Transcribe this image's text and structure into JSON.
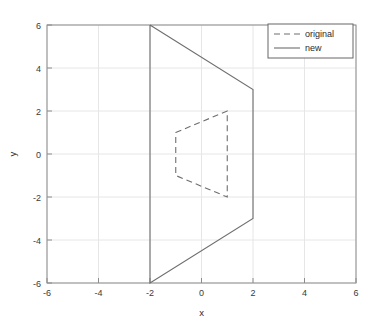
{
  "chart_data": {
    "type": "line",
    "title": "",
    "xlabel": "x",
    "ylabel": "y",
    "xlim": [
      -6,
      6
    ],
    "ylim": [
      -6,
      6
    ],
    "xticks": [
      "-6",
      "-4",
      "-2",
      "0",
      "2",
      "4",
      "6"
    ],
    "xtick_values": [
      -6,
      -4,
      -2,
      0,
      2,
      4,
      6
    ],
    "yticks": [
      "6",
      "4",
      "2",
      "0",
      "-2",
      "-4",
      "-6"
    ],
    "ytick_values": [
      6,
      4,
      2,
      0,
      -2,
      -4,
      -6
    ],
    "grid": true,
    "legend_position": "top-right",
    "background_color": "#ffffff",
    "grid_color": "#e6e6e6",
    "axis_color": "#8c8c8c",
    "series": [
      {
        "name": "original",
        "style": "dashed",
        "color": "#6e6e6e",
        "closed": true,
        "x": [
          -1,
          1,
          1,
          -1,
          -1
        ],
        "y": [
          1,
          2,
          -2,
          -1,
          1
        ]
      },
      {
        "name": "new",
        "style": "solid",
        "color": "#6e6e6e",
        "closed": true,
        "x": [
          -2,
          2,
          2,
          -2,
          -2
        ],
        "y": [
          6,
          3,
          -3,
          -6,
          6
        ]
      }
    ]
  },
  "legend": {
    "entries": [
      {
        "label": "original",
        "style": "dashed"
      },
      {
        "label": "new",
        "style": "solid"
      }
    ]
  },
  "axes": {
    "x_title": "x",
    "y_title": "y"
  }
}
